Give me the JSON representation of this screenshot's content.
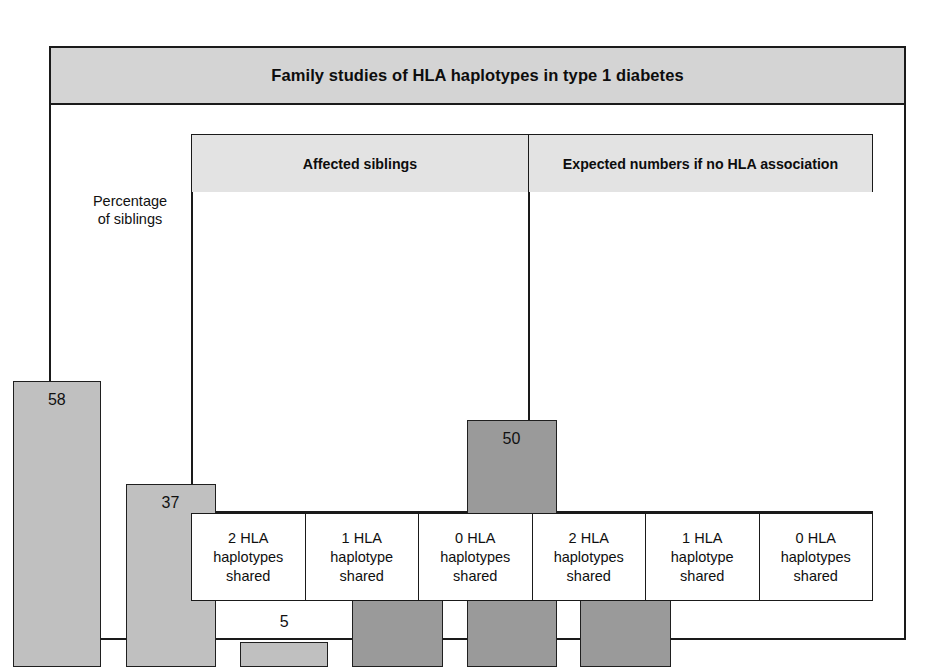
{
  "figure": {
    "title": "Family studies of HLA haplotypes in type 1 diabetes",
    "y_axis_label_line1": "Percentage",
    "y_axis_label_line2": "of siblings"
  },
  "panels": [
    {
      "name": "affected-siblings",
      "header": "Affected siblings"
    },
    {
      "name": "expected-numbers",
      "header": "Expected numbers if no HLA association"
    }
  ],
  "categories": [
    {
      "line1": "2 HLA",
      "line2": "haplotypes",
      "line3": "shared"
    },
    {
      "line1": "1 HLA",
      "line2": "haplotype",
      "line3": "shared"
    },
    {
      "line1": "0 HLA",
      "line2": "haplotypes",
      "line3": "shared"
    },
    {
      "line1": "2 HLA",
      "line2": "haplotypes",
      "line3": "shared"
    },
    {
      "line1": "1 HLA",
      "line2": "haplotype",
      "line3": "shared"
    },
    {
      "line1": "0 HLA",
      "line2": "haplotypes",
      "line3": "shared"
    }
  ],
  "bar_labels": {
    "b0": "58",
    "b1": "37",
    "b2": "5",
    "b3": "25",
    "b4": "50",
    "b5": "25"
  },
  "colors": {
    "title_band": "#d4d4d4",
    "panel_header": "#e3e3e3",
    "bar_observed": "#c0c0c0",
    "bar_expected": "#9a9a9a",
    "outline": "#1a1a1a",
    "page_background": "#ffffff"
  },
  "chart_data": {
    "type": "bar",
    "title": "Family studies of HLA haplotypes in type 1 diabetes",
    "xlabel": "",
    "ylabel": "Percentage of siblings",
    "ylim": [
      0,
      65
    ],
    "grid": false,
    "legend": "none",
    "panels": [
      {
        "name": "Affected siblings",
        "categories": [
          "2 HLA haplotypes shared",
          "1 HLA haplotype shared",
          "0 HLA haplotypes shared"
        ],
        "values": [
          58,
          37,
          5
        ],
        "color": "#c0c0c0"
      },
      {
        "name": "Expected numbers if no HLA association",
        "categories": [
          "2 HLA haplotypes shared",
          "1 HLA haplotype shared",
          "0 HLA haplotypes shared"
        ],
        "values": [
          25,
          50,
          25
        ],
        "color": "#9a9a9a"
      }
    ],
    "categories": [
      "2 HLA haplotypes shared",
      "1 HLA haplotype shared",
      "0 HLA haplotypes shared"
    ],
    "series": [
      {
        "name": "Affected siblings",
        "values": [
          58,
          37,
          5
        ]
      },
      {
        "name": "Expected numbers if no HLA association",
        "values": [
          25,
          50,
          25
        ]
      }
    ]
  }
}
